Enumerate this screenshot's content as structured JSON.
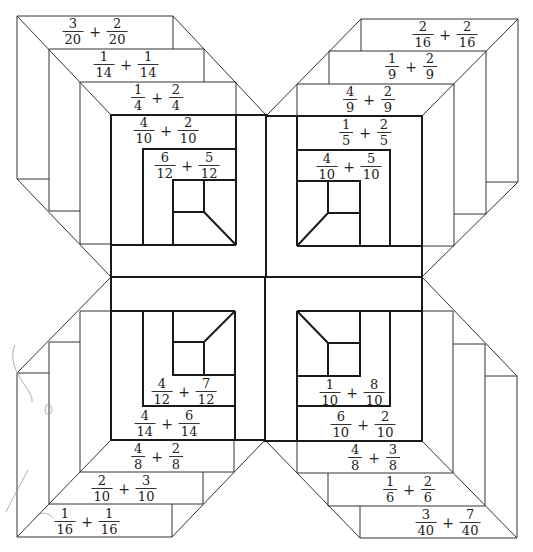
{
  "diagram": {
    "quadrants": {
      "top_left": {
        "problems": [
          {
            "a": {
              "num": "3",
              "den": "20"
            },
            "op": "+",
            "b": {
              "num": "2",
              "den": "20"
            }
          },
          {
            "a": {
              "num": "1",
              "den": "14"
            },
            "op": "+",
            "b": {
              "num": "1",
              "den": "14"
            }
          },
          {
            "a": {
              "num": "1",
              "den": "4"
            },
            "op": "+",
            "b": {
              "num": "2",
              "den": "4"
            }
          },
          {
            "a": {
              "num": "4",
              "den": "10"
            },
            "op": "+",
            "b": {
              "num": "2",
              "den": "10"
            }
          },
          {
            "a": {
              "num": "6",
              "den": "12"
            },
            "op": "+",
            "b": {
              "num": "5",
              "den": "12"
            }
          }
        ]
      },
      "top_right": {
        "problems": [
          {
            "a": {
              "num": "2",
              "den": "16"
            },
            "op": "+",
            "b": {
              "num": "2",
              "den": "16"
            }
          },
          {
            "a": {
              "num": "1",
              "den": "9"
            },
            "op": "+",
            "b": {
              "num": "2",
              "den": "9"
            }
          },
          {
            "a": {
              "num": "4",
              "den": "9"
            },
            "op": "+",
            "b": {
              "num": "2",
              "den": "9"
            }
          },
          {
            "a": {
              "num": "1",
              "den": "5"
            },
            "op": "+",
            "b": {
              "num": "2",
              "den": "5"
            }
          },
          {
            "a": {
              "num": "4",
              "den": "10"
            },
            "op": "+",
            "b": {
              "num": "5",
              "den": "10"
            }
          }
        ]
      },
      "bottom_left": {
        "problems": [
          {
            "a": {
              "num": "4",
              "den": "12"
            },
            "op": "+",
            "b": {
              "num": "7",
              "den": "12"
            }
          },
          {
            "a": {
              "num": "4",
              "den": "14"
            },
            "op": "+",
            "b": {
              "num": "6",
              "den": "14"
            }
          },
          {
            "a": {
              "num": "4",
              "den": "8"
            },
            "op": "+",
            "b": {
              "num": "2",
              "den": "8"
            }
          },
          {
            "a": {
              "num": "2",
              "den": "10"
            },
            "op": "+",
            "b": {
              "num": "3",
              "den": "10"
            }
          },
          {
            "a": {
              "num": "1",
              "den": "16"
            },
            "op": "+",
            "b": {
              "num": "1",
              "den": "16"
            }
          }
        ]
      },
      "bottom_right": {
        "problems": [
          {
            "a": {
              "num": "1",
              "den": "10"
            },
            "op": "+",
            "b": {
              "num": "8",
              "den": "10"
            }
          },
          {
            "a": {
              "num": "6",
              "den": "10"
            },
            "op": "+",
            "b": {
              "num": "2",
              "den": "10"
            }
          },
          {
            "a": {
              "num": "4",
              "den": "8"
            },
            "op": "+",
            "b": {
              "num": "3",
              "den": "8"
            }
          },
          {
            "a": {
              "num": "1",
              "den": "6"
            },
            "op": "+",
            "b": {
              "num": "2",
              "den": "6"
            }
          },
          {
            "a": {
              "num": "3",
              "den": "40"
            },
            "op": "+",
            "b": {
              "num": "7",
              "den": "40"
            }
          }
        ]
      }
    },
    "colors": {
      "line": "#333333",
      "bold_line": "#1a1a1a",
      "pencil_marks": "#9a9a9a",
      "background": "#ffffff"
    }
  }
}
